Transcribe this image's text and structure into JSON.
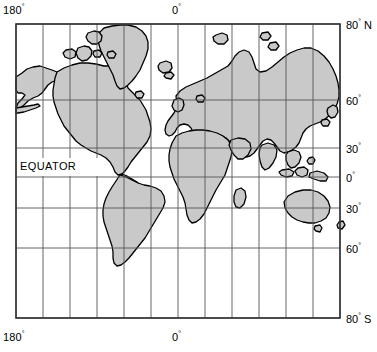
{
  "figure": {
    "type": "world-map",
    "projection": "mercator",
    "land_color": "#c9c9c9",
    "outline_color": "#000000",
    "grid_color": "#555555",
    "border_color": "#333333",
    "background_color": "#ffffff"
  },
  "annotations": {
    "equator": "EQUATOR"
  },
  "longitude_labels": {
    "top_left": {
      "value": "180",
      "symbol": "°"
    },
    "top_center": {
      "value": "0",
      "symbol": "°"
    },
    "bottom_left": {
      "value": "180",
      "symbol": "°"
    },
    "bottom_center": {
      "value": "0",
      "symbol": "°"
    }
  },
  "latitude_labels": [
    {
      "value": "80",
      "symbol": "°",
      "hemisphere": " N",
      "y": 18
    },
    {
      "value": "60",
      "symbol": "°",
      "hemisphere": "",
      "y": 94
    },
    {
      "value": "30",
      "symbol": "°",
      "hemisphere": "",
      "y": 142
    },
    {
      "value": "0",
      "symbol": "°",
      "hemisphere": "",
      "y": 171
    },
    {
      "value": "30",
      "symbol": "°",
      "hemisphere": "",
      "y": 202
    },
    {
      "value": "60",
      "symbol": "°",
      "hemisphere": "",
      "y": 242
    },
    {
      "value": "80",
      "symbol": "°",
      "hemisphere": " S",
      "y": 312
    }
  ],
  "grid": {
    "longitude_step_degrees": 30,
    "longitude_lines": [
      -180,
      -150,
      -120,
      -90,
      -60,
      -30,
      0,
      30,
      60,
      90,
      120,
      150,
      180
    ],
    "latitude_lines_degrees": [
      80,
      60,
      30,
      0,
      -30,
      -60,
      -80
    ],
    "map_bounds_px": {
      "left": 16,
      "top": 24,
      "right": 340,
      "bottom": 318
    }
  }
}
